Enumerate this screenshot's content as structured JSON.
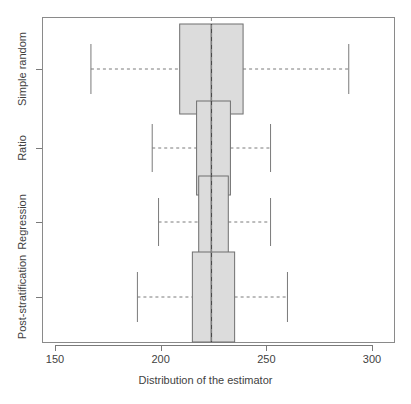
{
  "chart_data": {
    "type": "boxplot",
    "title": "",
    "xlabel": "Distribution of the estimator",
    "ylabel": "",
    "orientation": "horizontal",
    "xlim": [
      140,
      310
    ],
    "xticks": [
      150,
      200,
      250,
      300
    ],
    "xtick_labels": [
      "150",
      "200",
      "250",
      "300"
    ],
    "grid": false,
    "legend": null,
    "reference_line": {
      "value": 224,
      "style": "dashed",
      "orientation": "vertical",
      "color": "#8a8a8a"
    },
    "categories": [
      "Simple random",
      "Ratio",
      "Regression",
      "Post-stratification"
    ],
    "boxes": [
      {
        "label": "Simple random",
        "whisker_low": 167,
        "q1": 209,
        "median": 224,
        "q3": 239,
        "whisker_high": 289,
        "outliers": []
      },
      {
        "label": "Ratio",
        "whisker_low": 196,
        "q1": 217,
        "median": 224,
        "q3": 233,
        "whisker_high": 252,
        "outliers": []
      },
      {
        "label": "Regression",
        "whisker_low": 199,
        "q1": 218,
        "median": 224,
        "q3": 232,
        "whisker_high": 252,
        "outliers": []
      },
      {
        "label": "Post-stratification",
        "whisker_low": 189,
        "q1": 215,
        "median": 224,
        "q3": 235,
        "whisker_high": 260,
        "outliers": []
      }
    ],
    "colors": {
      "box_fill": "#dcdcdc",
      "box_border": "#6f6f6f",
      "median": "#4a4a4a",
      "whisker": "#7a7a7a",
      "frame": "#8a8a8a",
      "text": "#3f3f3f",
      "background": "#ffffff"
    }
  }
}
